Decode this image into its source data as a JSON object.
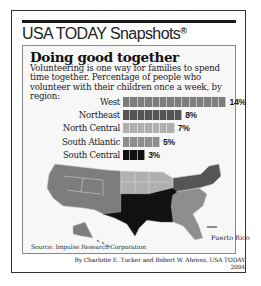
{
  "header": {
    "brand": "USA TODAY Snapshots",
    "brand_mark": "®"
  },
  "graphic": {
    "title": "Doing good together",
    "subtitle": "Volunteering is one way for families to spend time together. Percentage of people who volunteer with their children once a week, by region:",
    "source": "Source: Impulse Research Corporation",
    "map_label": "Puerto Rico",
    "credit_line1": "By Charlotte E. Tucker and Robert W. Ahrens, USA TODAY",
    "credit_line2": "2004"
  },
  "colors": {
    "West": "#7d7d7d",
    "Northeast": "#555555",
    "North Central": "#b0b0b0",
    "South Atlantic": "#8e8e8e",
    "South Central": "#111111",
    "background": "#f7f7f7"
  },
  "chart_data": {
    "type": "bar",
    "orientation": "horizontal",
    "title": "Doing good together",
    "subtitle": "Volunteering is one way for families to spend time together. Percentage of people who volunteer with their children once a week, by region:",
    "categories": [
      "West",
      "Northeast",
      "North Central",
      "South Atlantic",
      "South Central"
    ],
    "values": [
      14,
      8,
      7,
      5,
      3
    ],
    "value_labels": [
      "14%",
      "8%",
      "7%",
      "5%",
      "3%"
    ],
    "unit": "%",
    "xlabel": "",
    "ylabel": "",
    "grid": false,
    "legend": "map (regions shaded by matching bar color)",
    "source": "Source: Impulse Research Corporation"
  }
}
